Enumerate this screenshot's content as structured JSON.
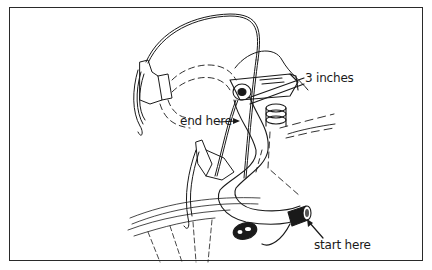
{
  "figure": {
    "labels": {
      "three_inches": "3 inches",
      "end_here": "end here",
      "start_here": "start here"
    },
    "colors": {
      "ink": "#1a1a1a",
      "background": "#ffffff",
      "frame_border": "#2a2a2a"
    }
  }
}
